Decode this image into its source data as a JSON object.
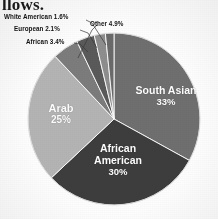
{
  "document": {
    "partial_text_top": "llows."
  },
  "chart_data": {
    "type": "pie",
    "title": "",
    "subtitle": "",
    "xlabel": "",
    "ylabel": "",
    "legend_position": "none",
    "grid": false,
    "labels_inside": [
      "South Asian",
      "African American",
      "Arab"
    ],
    "labels_callout": [
      "Other",
      "African",
      "European",
      "White American"
    ],
    "categories": [
      "South Asian",
      "African American",
      "Arab",
      "Other",
      "African",
      "European",
      "White American"
    ],
    "values": [
      33,
      30,
      25,
      4.9,
      3.4,
      2.1,
      1.6
    ],
    "value_strings": [
      "33%",
      "30%",
      "25%",
      "4.9%",
      "3.4%",
      "2.1%",
      "1.6%"
    ],
    "slices": [
      {
        "name": "South Asian",
        "value": 33,
        "display": "33%",
        "label": "South Asian 33%",
        "color": "#6f6f6f",
        "placement": "inside"
      },
      {
        "name": "African American",
        "value": 30,
        "display": "30%",
        "label": "African American 30%",
        "color": "#3d3d3d",
        "placement": "inside"
      },
      {
        "name": "Arab",
        "value": 25,
        "display": "25%",
        "label": "Arab 25%",
        "color": "#b4b4b4",
        "placement": "inside"
      },
      {
        "name": "Other",
        "value": 4.9,
        "display": "4.9%",
        "label": "Other 4.9%",
        "color": "#7c7c7c",
        "placement": "callout"
      },
      {
        "name": "African",
        "value": 3.4,
        "display": "3.4%",
        "label": "African 3.4%",
        "color": "#5a5a5a",
        "placement": "callout"
      },
      {
        "name": "European",
        "value": 2.1,
        "display": "2.1%",
        "label": "European 2.1%",
        "color": "#8e8e8e",
        "placement": "callout"
      },
      {
        "name": "White American",
        "value": 1.6,
        "display": "1.6%",
        "label": "White American 1.6%",
        "color": "#6a6a6a",
        "placement": "callout"
      }
    ],
    "total": 100
  },
  "callouts": {
    "white_american": "White American 1.6%",
    "european": "European 2.1%",
    "african": "African 3.4%",
    "other": "Other 4.9%"
  },
  "inside_labels": {
    "south_asian_name": "South Asian",
    "south_asian_pct": "33%",
    "african_american_name_line1": "African",
    "african_american_name_line2": "American",
    "african_american_pct": "30%",
    "arab_name": "Arab",
    "arab_pct": "25%"
  },
  "colors": {
    "south_asian": "#6f6f6f",
    "african_american": "#3d3d3d",
    "arab": "#b4b4b4",
    "other": "#7c7c7c",
    "african": "#5a5a5a",
    "european": "#8e8e8e",
    "white_american": "#6a6a6a",
    "label_text": "#121212",
    "slice_text": "#ffffff",
    "background": "#fdfdfd",
    "leader_line": "#ffffff"
  }
}
